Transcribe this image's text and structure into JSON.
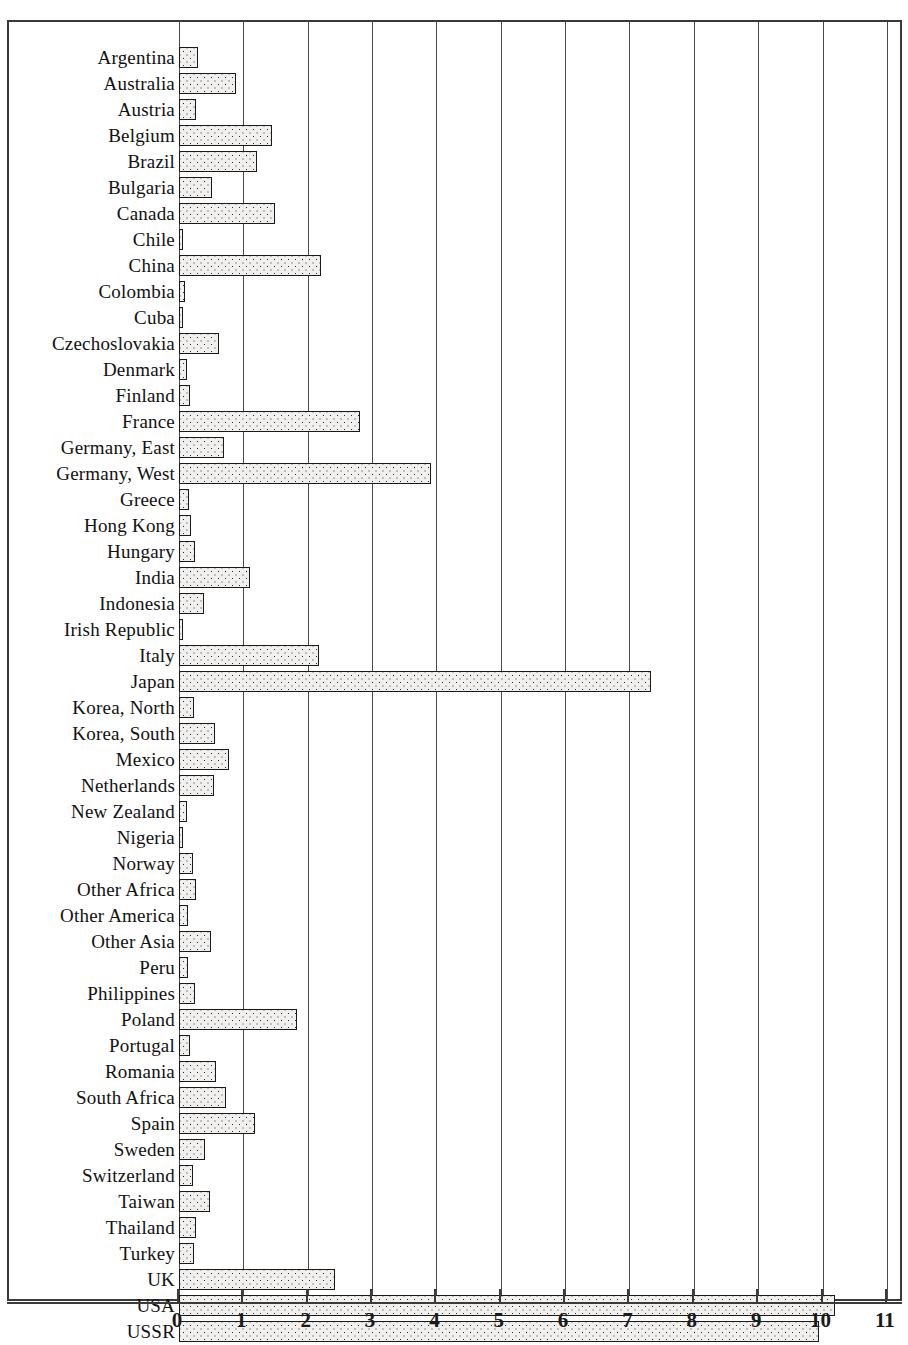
{
  "figure": {
    "clipped_title_text": "",
    "axis_label_bottom": ""
  },
  "chart_data": {
    "type": "bar",
    "orientation": "horizontal",
    "title": "",
    "xlabel": "",
    "ylabel": "",
    "xlim": [
      0,
      11
    ],
    "xticks": [
      "0",
      "1",
      "2",
      "3",
      "4",
      "5",
      "6",
      "7",
      "8",
      "9",
      "10",
      "11"
    ],
    "grid": true,
    "legend": null,
    "categories": [
      "Argentina",
      "Australia",
      "Austria",
      "Belgium",
      "Brazil",
      "Bulgaria",
      "Canada",
      "Chile",
      "China",
      "Colombia",
      "Cuba",
      "Czechoslovakia",
      "Denmark",
      "Finland",
      "France",
      "Germany, East",
      "Germany, West",
      "Greece",
      "Hong Kong",
      "Hungary",
      "India",
      "Indonesia",
      "Irish Republic",
      "Italy",
      "Japan",
      "Korea, North",
      "Korea, South",
      "Mexico",
      "Netherlands",
      "New Zealand",
      "Nigeria",
      "Norway",
      "Other Africa",
      "Other America",
      "Other Asia",
      "Peru",
      "Philippines",
      "Poland",
      "Portugal",
      "Romania",
      "South Africa",
      "Spain",
      "Sweden",
      "Switzerland",
      "Taiwan",
      "Thailand",
      "Turkey",
      "UK",
      "USA",
      "USSR",
      "Venezuela",
      "Yugoslavia"
    ],
    "values": [
      0.3,
      0.88,
      0.26,
      1.44,
      1.21,
      0.52,
      1.49,
      0.05,
      2.21,
      0.1,
      0.03,
      0.62,
      0.13,
      0.17,
      2.81,
      0.7,
      3.91,
      0.15,
      0.18,
      0.25,
      1.1,
      0.39,
      0.04,
      2.17,
      7.34,
      0.23,
      0.56,
      0.77,
      0.55,
      0.12,
      0.06,
      0.21,
      0.27,
      0.14,
      0.5,
      0.14,
      0.25,
      1.83,
      0.17,
      0.58,
      0.73,
      1.18,
      0.4,
      0.22,
      0.48,
      0.27,
      0.24,
      2.42,
      10.2,
      9.94,
      0.13,
      0.7
    ]
  }
}
